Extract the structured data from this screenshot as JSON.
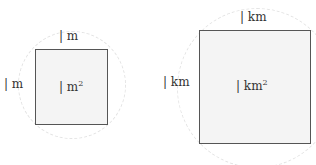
{
  "small": {
    "side_top": "| m",
    "side_left": "| m",
    "area_base": "| m",
    "area_exp": "2"
  },
  "large": {
    "side_top": "| km",
    "side_left": "| km",
    "area_base": "| km",
    "area_exp": "2"
  },
  "colors": {
    "square_border": "#555555",
    "square_fill": "#f4f4f4",
    "circle": "#e4e4e4"
  }
}
